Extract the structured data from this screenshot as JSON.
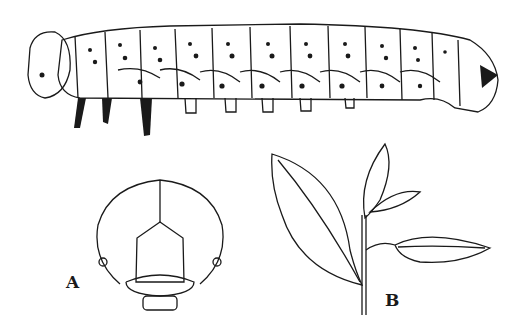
{
  "figure": {
    "panels": [
      {
        "id": "caterpillar",
        "description": "larva side view"
      },
      {
        "id": "A",
        "label": "A",
        "description": "head capsule front view"
      },
      {
        "id": "B",
        "label": "B",
        "description": "leafy twig with feeding damage"
      }
    ],
    "labels": {
      "a": "A",
      "b": "B"
    },
    "colors": {
      "ink": "#1a1a1a",
      "paper": "#ffffff"
    }
  }
}
